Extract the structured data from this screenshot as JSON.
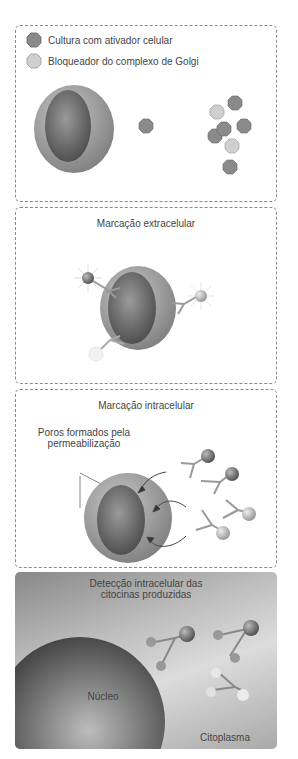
{
  "colors": {
    "activator": "#8a8a8a",
    "golgi_blocker": "#cfcfcf",
    "cell_outer": "#a0a0a0",
    "nucleus": "#6a6a6a",
    "panel_border": "#8a8a8a"
  },
  "panel1": {
    "legend": [
      {
        "icon": "dark-octagon-icon",
        "label": "Cultura com ativador celular"
      },
      {
        "icon": "light-octagon-icon",
        "label": "Bloqueador do complexo de Golgi"
      }
    ]
  },
  "panel2": {
    "title": "Marcação extracelular"
  },
  "panel3": {
    "title": "Marcação intracelular",
    "annotation_line1": "Poros formados pela",
    "annotation_line2": "permeabilização"
  },
  "panel4": {
    "title_line1": "Detecção intracelular das",
    "title_line2": "citocinas produzidas",
    "nucleus_label": "Núcleo",
    "cytoplasm_label": "Citoplasma"
  }
}
